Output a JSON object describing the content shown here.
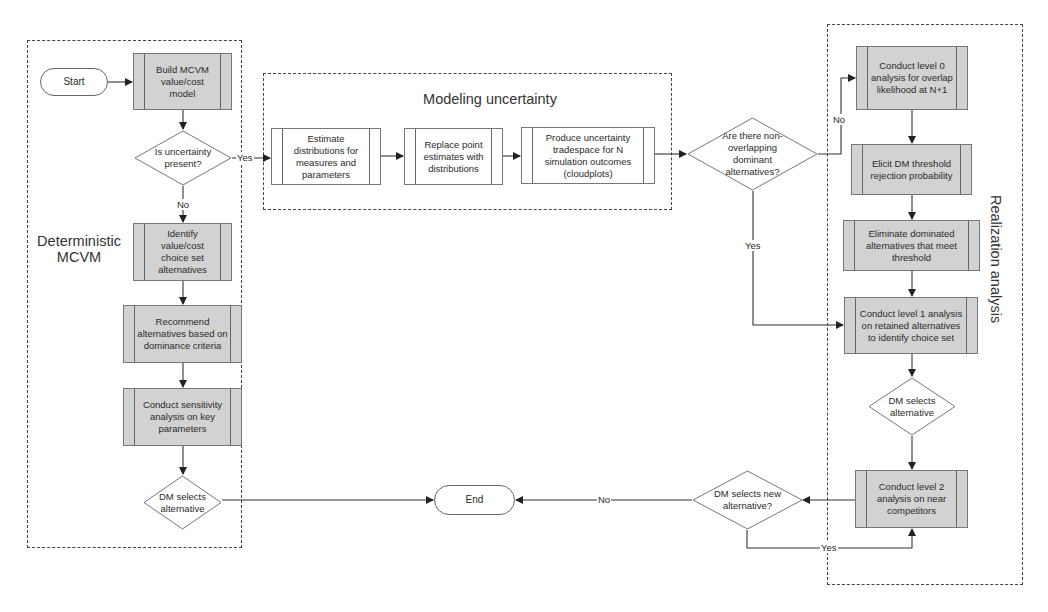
{
  "groups": {
    "deterministic": {
      "title_line1": "Deterministic",
      "title_line2": "MCVM"
    },
    "modeling": {
      "title": "Modeling uncertainty"
    },
    "realization": {
      "title": "Realization analysis"
    }
  },
  "nodes": {
    "start": "Start",
    "build": "Build MCVM value/cost model",
    "uncertainty_q": "Is uncertainty present?",
    "identify": "Identify value/cost choice set alternatives",
    "recommend": "Recommend alternatives based on dominance criteria",
    "sensitivity": "Conduct sensitivity analysis on key parameters",
    "dm_selects_left": "DM selects alternative",
    "estimate": "Estimate distributions for measures and parameters",
    "replace": "Replace point estimates with distributions",
    "produce": "Produce uncertainty tradespace for N simulation outcomes (cloudplots)",
    "nonoverlap_q": "Are there non-overlapping dominant alternatives?",
    "level0": "Conduct level 0 analysis for overlap likelihood at N+1",
    "elicit": "Elicit DM threshold rejection probability",
    "eliminate": "Eliminate dominated alternatives that meet threshold",
    "level1": "Conduct level 1 analysis on retained alternatives to identify choice set",
    "dm_selects_right": "DM selects alternative",
    "level2": "Conduct level 2 analysis on near competitors",
    "new_alt_q": "DM selects new alternative?",
    "end": "End"
  },
  "edge_labels": {
    "uncertainty_yes": "Yes",
    "uncertainty_no": "No",
    "nonoverlap_no": "No",
    "nonoverlap_yes": "Yes",
    "new_alt_no": "No",
    "new_alt_yes": "Yes"
  },
  "colors": {
    "process_fill": "#d2d2d2",
    "line": "#333333",
    "group_border": "#444444"
  }
}
